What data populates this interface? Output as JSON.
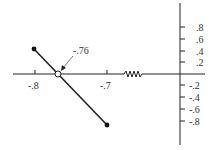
{
  "diagram": {
    "type": "root-locus",
    "real_axis": {
      "tick_labels": [
        "-.8",
        "-.7"
      ],
      "tick_values": [
        -0.8,
        -0.7
      ]
    },
    "imag_axis": {
      "positive_labels": [
        ".8",
        ".6",
        ".4",
        ".2"
      ],
      "negative_labels": [
        "-.2",
        "-.4",
        "-.6",
        "-.8"
      ]
    },
    "annotation": {
      "label": "-.76",
      "value": -0.76
    },
    "branch": {
      "start": "upper-left closed pole",
      "end": "lower-right closed pole",
      "crossing": "open circle at real axis"
    },
    "break_symbol": "zigzag"
  }
}
